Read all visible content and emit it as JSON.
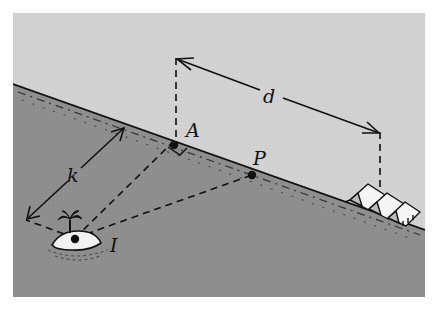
{
  "figure": {
    "colors": {
      "land": "#d2d2d2",
      "sea": "#8e8e8e",
      "line": "#111111",
      "island": "#f2f2f2",
      "background": "#ffffff"
    },
    "labels": {
      "A": "A",
      "P": "P",
      "I": "I",
      "k": "k",
      "d": "d"
    },
    "points": {
      "A": {
        "label": "A",
        "x": 174,
        "y": 141
      },
      "P": {
        "label": "P",
        "x": 252,
        "y": 175
      },
      "I": {
        "label": "I",
        "x": 75,
        "y": 238
      }
    },
    "dimensions": [
      {
        "label": "k",
        "meaning": "perpendicular distance from island to shore"
      },
      {
        "label": "d",
        "meaning": "distance along shore from A to camp"
      }
    ]
  }
}
